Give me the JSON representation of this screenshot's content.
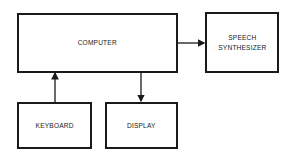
{
  "diagram": {
    "nodes": [
      {
        "id": "computer",
        "label": "COMPUTER"
      },
      {
        "id": "speech",
        "label": "SPEECH\nSYNTHESIZER"
      },
      {
        "id": "keyboard",
        "label": "KEYBOARD"
      },
      {
        "id": "display",
        "label": "DISPLAY"
      }
    ],
    "edges": [
      {
        "from": "computer",
        "to": "speech"
      },
      {
        "from": "keyboard",
        "to": "computer"
      },
      {
        "from": "computer",
        "to": "display"
      }
    ],
    "stroke_color": "#1a1a1a"
  }
}
